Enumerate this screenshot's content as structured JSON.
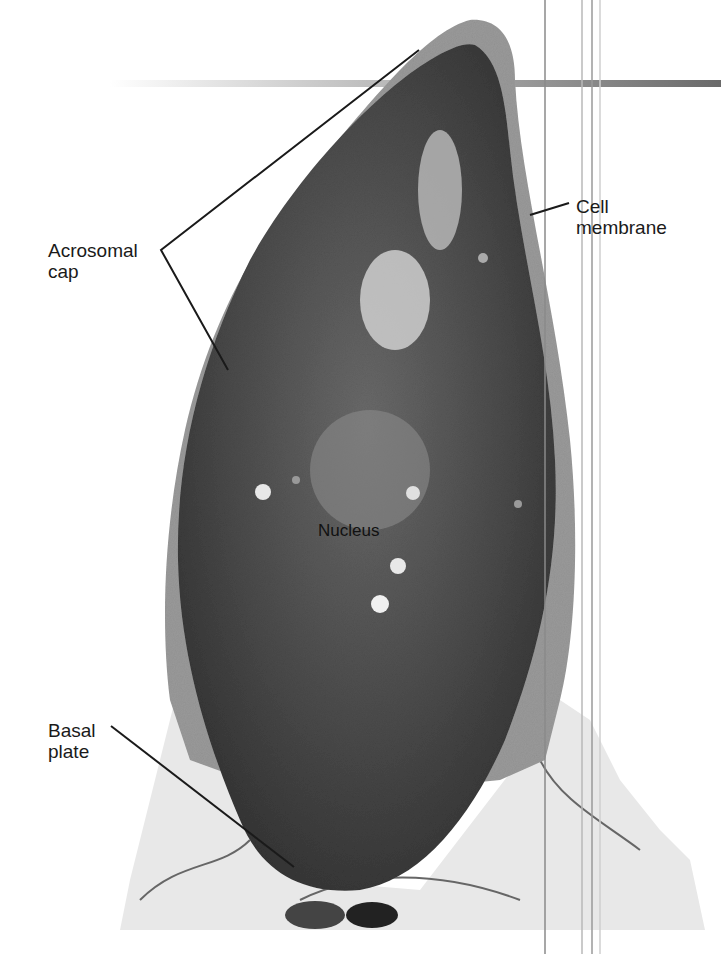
{
  "figure": {
    "colors": {
      "background": "#ffffff",
      "nucleus_dark": "#3a3a3a",
      "nucleus_mid": "#555555",
      "membrane_gray": "#9a9a9a",
      "surrounding_tissue": "#e6e6e6",
      "leader_line": "#1a1a1a"
    }
  },
  "labels": {
    "acrosomal_cap": "Acrosomal\ncap",
    "cell_membrane": "Cell\nmembrane",
    "nucleus": "Nucleus",
    "basal_plate": "Basal\nplate"
  }
}
